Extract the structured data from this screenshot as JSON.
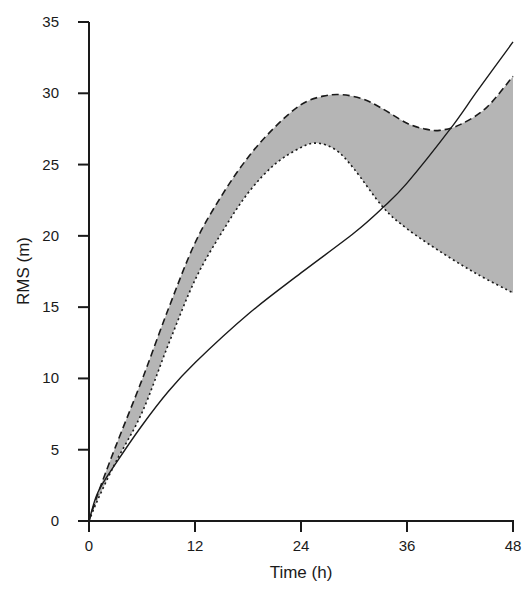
{
  "chart_data": {
    "type": "line",
    "title": "",
    "xlabel": "Time (h)",
    "ylabel": "RMS (m)",
    "xlim": [
      0,
      48
    ],
    "ylim": [
      0,
      35
    ],
    "xticks": [
      0,
      12,
      24,
      36,
      48
    ],
    "yticks": [
      0,
      5,
      10,
      15,
      20,
      25,
      30,
      35
    ],
    "grid": false,
    "legend": null,
    "series": [
      {
        "name": "solid",
        "style": "solid",
        "x": [
          0,
          1,
          3,
          6,
          9,
          12,
          18,
          24,
          30,
          33.3,
          36,
          40.9,
          44,
          48
        ],
        "y": [
          0,
          2.0,
          4.0,
          6.7,
          9.1,
          11.1,
          14.5,
          17.4,
          20.2,
          22.0,
          23.7,
          27.5,
          30.2,
          33.6
        ]
      },
      {
        "name": "upper-bound-dashed",
        "style": "dashed",
        "x": [
          0,
          1,
          3,
          6,
          9,
          12,
          15,
          18,
          21,
          24,
          26.5,
          28.7,
          31,
          33,
          36,
          38,
          39.7,
          42,
          45,
          48
        ],
        "y": [
          0,
          1.9,
          5.2,
          9.9,
          14.9,
          19.5,
          22.8,
          25.5,
          27.6,
          29.2,
          29.8,
          29.9,
          29.6,
          29.0,
          27.9,
          27.5,
          27.4,
          27.8,
          29.0,
          31.2
        ]
      },
      {
        "name": "lower-bound-dotted",
        "style": "dotted",
        "x": [
          0,
          1,
          3,
          6,
          9,
          12,
          15,
          18,
          21,
          24,
          25.9,
          28,
          30,
          33.3,
          36,
          40,
          44,
          48
        ],
        "y": [
          0,
          1.5,
          4.1,
          7.6,
          12.4,
          16.9,
          20.2,
          23.0,
          25.0,
          26.2,
          26.5,
          26.0,
          24.7,
          22.0,
          20.5,
          18.8,
          17.3,
          16.0
        ]
      }
    ],
    "fill_between": {
      "upper": "upper-bound-dashed",
      "lower": "lower-bound-dotted",
      "color": "#b5b5b5"
    }
  },
  "colors": {
    "line": "#1a1a1a",
    "fill": "#b5b5b5",
    "background": "#ffffff"
  }
}
